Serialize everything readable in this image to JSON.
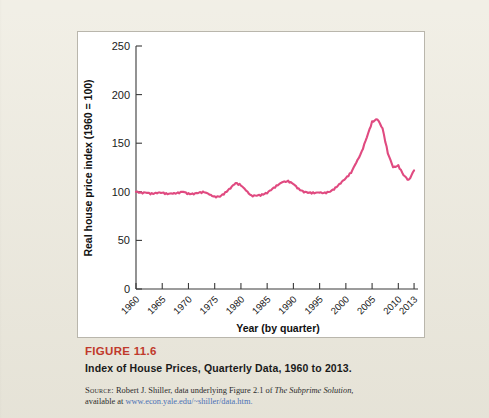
{
  "figure": {
    "label": "FIGURE 11.6",
    "label_color": "#c0392b",
    "title": "Index of House Prices, Quarterly Data, 1960 to 2013.",
    "source_kicker": "Source:",
    "source_text_1": " Robert J. Shiller, data underlying Figure 2.1 of ",
    "source_italic": "The Subprime Solution,",
    "source_text_2": "available at ",
    "source_link": "www.econ.yale.edu/~shiller/data.htm.",
    "source_link_color": "#4a6fb5"
  },
  "page": {
    "background_color": "#edeade",
    "panel_color": "#ffffff",
    "panel_border_color": "#b9b6ac"
  },
  "chart_data": {
    "type": "line",
    "title": "",
    "xlabel": "Year (by quarter)",
    "ylabel": "Real house price index (1960 = 100)",
    "xlim": [
      1960,
      2013.75
    ],
    "ylim": [
      0,
      250
    ],
    "grid": false,
    "legend": "none",
    "line_color": "#e04a80",
    "xticks": [
      1960,
      1965,
      1970,
      1975,
      1980,
      1985,
      1990,
      1995,
      2000,
      2005,
      2010,
      2013
    ],
    "xtick_labels": [
      "1960",
      "1965",
      "1970",
      "1975",
      "1980",
      "1985",
      "1990",
      "1995",
      "2000",
      "2005",
      "2010",
      "2013"
    ],
    "yticks": [
      0,
      50,
      100,
      150,
      200,
      250
    ],
    "ytick_labels": [
      "0",
      "50",
      "100",
      "150",
      "200",
      "250"
    ],
    "series": [
      {
        "name": "Real house price index",
        "x": [
          1960,
          1961,
          1962,
          1963,
          1964,
          1965,
          1966,
          1967,
          1968,
          1969,
          1970,
          1971,
          1972,
          1973,
          1974,
          1975,
          1976,
          1977,
          1978,
          1979,
          1980,
          1981,
          1982,
          1983,
          1984,
          1985,
          1986,
          1987,
          1988,
          1989,
          1990,
          1991,
          1992,
          1993,
          1994,
          1995,
          1996,
          1997,
          1998,
          1999,
          2000,
          2001,
          2002,
          2003,
          2004,
          2005,
          2006,
          2007,
          2008,
          2009,
          2010,
          2011,
          2012,
          2013
        ],
        "values": [
          100,
          99,
          99,
          98,
          99,
          99,
          98,
          98,
          99,
          100,
          98,
          98,
          99,
          100,
          97,
          95,
          95,
          99,
          104,
          109,
          107,
          101,
          96,
          96,
          97,
          99,
          103,
          107,
          110,
          111,
          108,
          103,
          100,
          99,
          99,
          99,
          99,
          100,
          104,
          109,
          114,
          120,
          130,
          141,
          156,
          172,
          175,
          165,
          140,
          125,
          127,
          117,
          112,
          122
        ]
      }
    ]
  }
}
